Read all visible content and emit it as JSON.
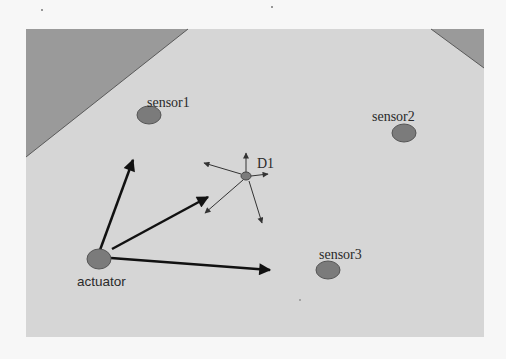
{
  "figure": {
    "type": "sensor-actuator network diagram",
    "colors": {
      "page_background": "#f7f7f7",
      "field_background": "#d6d6d6",
      "obstacle_fill": "#9a9a9a",
      "obstacle_edge": "#5a5a5a",
      "node_fill": "#7b7b7b",
      "node_stroke": "#555555",
      "strong_arrow": "#111111",
      "thin_arrow": "#4a4a4a",
      "label_text": "#2a2a2a"
    }
  },
  "nodes": [
    {
      "id": "sensor1",
      "label": "sensor1",
      "role": "sensor"
    },
    {
      "id": "sensor2",
      "label": "sensor2",
      "role": "sensor"
    },
    {
      "id": "sensor3",
      "label": "sensor3",
      "role": "sensor"
    },
    {
      "id": "actuator",
      "label": "actuator",
      "role": "actuator"
    },
    {
      "id": "D1",
      "label": "D1",
      "role": "diffusing source"
    }
  ],
  "obstacles": [
    {
      "id": "obstacle-top-left",
      "shape": "triangle"
    },
    {
      "id": "obstacle-top-right",
      "shape": "triangle"
    }
  ],
  "actuator_arrows": [
    {
      "from": "actuator",
      "toward": "sensor1 region",
      "weight": "bold"
    },
    {
      "from": "actuator",
      "toward": "D1 region",
      "weight": "bold"
    },
    {
      "from": "actuator",
      "toward": "sensor3 region",
      "weight": "bold"
    }
  ],
  "dispersion_arrows": [
    {
      "from": "D1",
      "direction": "up"
    },
    {
      "from": "D1",
      "direction": "upper-left"
    },
    {
      "from": "D1",
      "direction": "right"
    },
    {
      "from": "D1",
      "direction": "lower-left"
    },
    {
      "from": "D1",
      "direction": "lower-right"
    }
  ]
}
